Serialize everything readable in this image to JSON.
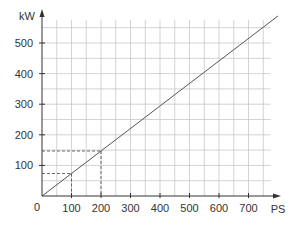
{
  "chart_data": {
    "type": "line",
    "title": "",
    "xlabel": "PS",
    "ylabel": "kW",
    "origin_label": "0",
    "x_ticks": [
      100,
      200,
      300,
      400,
      500,
      600,
      700
    ],
    "y_ticks": [
      100,
      200,
      300,
      400,
      500
    ],
    "xlim": [
      0,
      780
    ],
    "ylim": [
      0,
      580
    ],
    "grid": true,
    "grid_step_x": 50,
    "grid_step_y": 50,
    "series": [
      {
        "name": "kW = 0.7355 × PS",
        "x": [
          0,
          800
        ],
        "y": [
          0,
          588.4
        ]
      }
    ],
    "annotations": [
      {
        "type": "dashed-guide",
        "x": 100,
        "y": 73.55
      },
      {
        "type": "dashed-guide",
        "x": 200,
        "y": 147.1
      }
    ],
    "colors": {
      "line": "#555555",
      "grid": "#c8c8c8",
      "axis": "#333333"
    }
  }
}
